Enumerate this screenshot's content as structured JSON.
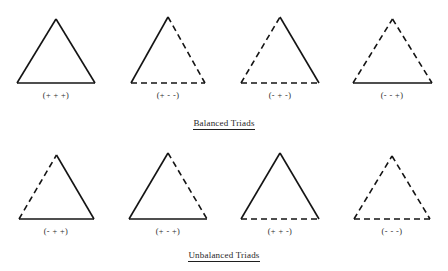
{
  "figure": {
    "title_balanced": "Balanced Triads",
    "title_unbalanced": "Unbalanced Triads",
    "legend": {
      "solid_meaning": "+",
      "dashed_meaning": "-"
    },
    "rows": [
      {
        "name": "balanced",
        "caption": "Balanced Triads",
        "triads": [
          {
            "label": "(+ + +)",
            "left": "+",
            "right": "+",
            "bottom": "+",
            "width": 78,
            "height": 64
          },
          {
            "label": "(+ - -)",
            "left": "+",
            "right": "-",
            "bottom": "-",
            "width": 74,
            "height": 66
          },
          {
            "label": "(- + -)",
            "left": "-",
            "right": "+",
            "bottom": "-",
            "width": 78,
            "height": 66
          },
          {
            "label": "(- - +)",
            "left": "-",
            "right": "-",
            "bottom": "+",
            "width": 79,
            "height": 64
          }
        ]
      },
      {
        "name": "unbalanced",
        "caption": "Unbalanced Triads",
        "triads": [
          {
            "label": "(- + +)",
            "left": "-",
            "right": "+",
            "bottom": "+",
            "width": 75,
            "height": 64
          },
          {
            "label": "(+ - +)",
            "left": "+",
            "right": "-",
            "bottom": "+",
            "width": 78,
            "height": 66
          },
          {
            "label": "(+ + -)",
            "left": "+",
            "right": "+",
            "bottom": "-",
            "width": 78,
            "height": 66
          },
          {
            "label": "(- - -)",
            "left": "-",
            "right": "-",
            "bottom": "-",
            "width": 76,
            "height": 63
          }
        ]
      }
    ]
  },
  "style": {
    "stroke_color": "#141414",
    "background": "#ffffff",
    "stroke_width": 1.6,
    "dash_pattern": "6 4"
  }
}
